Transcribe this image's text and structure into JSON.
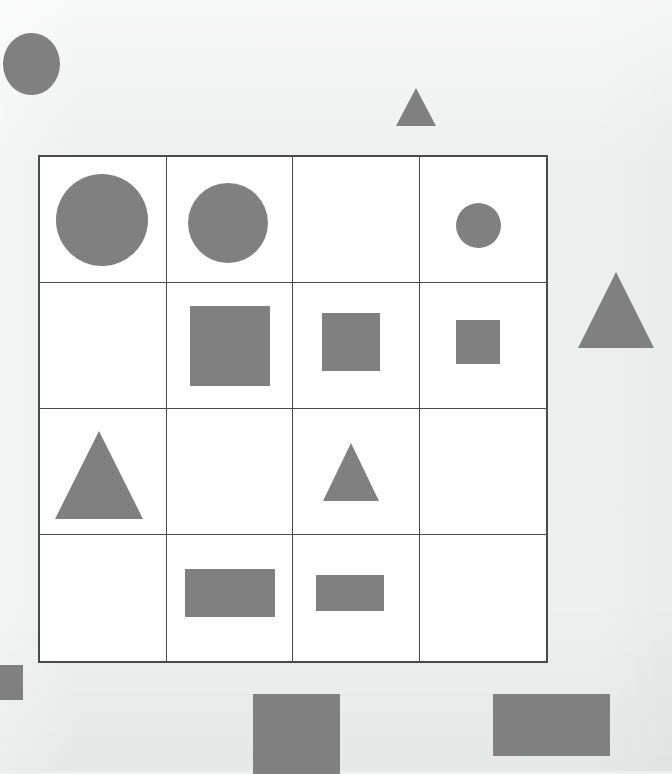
{
  "page": {
    "background_color": "#eef0ef",
    "width": 672,
    "height": 771
  },
  "matrix": {
    "name": "shape-matrix",
    "rows": 4,
    "cols": 4,
    "x": 38,
    "y": 155,
    "width": 510,
    "height": 508,
    "cell_width": 127,
    "cell_height": 127,
    "cell_fill": "#ffffff",
    "border_color": "#4a4a4a",
    "border_width": 2,
    "divider_width": 1,
    "shape_color": "#808080",
    "cells": [
      {
        "row": 0,
        "col": 0,
        "shape": "circle",
        "size": "large",
        "w": 92,
        "h": 92,
        "cx": 0.49,
        "cy": 0.5
      },
      {
        "row": 0,
        "col": 1,
        "shape": "circle",
        "size": "medium",
        "w": 80,
        "h": 80,
        "cx": 0.49,
        "cy": 0.52
      },
      {
        "row": 0,
        "col": 2,
        "shape": "none",
        "size": "",
        "w": 0,
        "h": 0,
        "cx": 0.5,
        "cy": 0.5
      },
      {
        "row": 0,
        "col": 3,
        "shape": "circle",
        "size": "small",
        "w": 45,
        "h": 45,
        "cx": 0.47,
        "cy": 0.54
      },
      {
        "row": 1,
        "col": 0,
        "shape": "none",
        "size": "",
        "w": 0,
        "h": 0,
        "cx": 0.5,
        "cy": 0.5
      },
      {
        "row": 1,
        "col": 1,
        "shape": "square",
        "size": "large",
        "w": 80,
        "h": 80,
        "cx": 0.5,
        "cy": 0.5
      },
      {
        "row": 1,
        "col": 2,
        "shape": "square",
        "size": "medium",
        "w": 58,
        "h": 58,
        "cx": 0.46,
        "cy": 0.47
      },
      {
        "row": 1,
        "col": 3,
        "shape": "square",
        "size": "small",
        "w": 44,
        "h": 44,
        "cx": 0.46,
        "cy": 0.47
      },
      {
        "row": 2,
        "col": 0,
        "shape": "triangle",
        "size": "large",
        "w": 88,
        "h": 88,
        "cx": 0.47,
        "cy": 0.52
      },
      {
        "row": 2,
        "col": 1,
        "shape": "none",
        "size": "",
        "w": 0,
        "h": 0,
        "cx": 0.5,
        "cy": 0.5
      },
      {
        "row": 2,
        "col": 2,
        "shape": "triangle",
        "size": "medium",
        "w": 56,
        "h": 58,
        "cx": 0.46,
        "cy": 0.5
      },
      {
        "row": 2,
        "col": 3,
        "shape": "none",
        "size": "",
        "w": 0,
        "h": 0,
        "cx": 0.5,
        "cy": 0.5
      },
      {
        "row": 3,
        "col": 0,
        "shape": "none",
        "size": "",
        "w": 0,
        "h": 0,
        "cx": 0.5,
        "cy": 0.5
      },
      {
        "row": 3,
        "col": 1,
        "shape": "rect",
        "size": "large",
        "w": 90,
        "h": 48,
        "cx": 0.5,
        "cy": 0.46
      },
      {
        "row": 3,
        "col": 2,
        "shape": "rect",
        "size": "medium",
        "w": 68,
        "h": 36,
        "cx": 0.45,
        "cy": 0.46
      },
      {
        "row": 3,
        "col": 3,
        "shape": "none",
        "size": "",
        "w": 0,
        "h": 0,
        "cx": 0.5,
        "cy": 0.5
      }
    ]
  },
  "distractors": [
    {
      "name": "distractor-circle-top-left",
      "shape": "circle",
      "x": 3,
      "y": 33,
      "w": 57,
      "h": 62,
      "color": "#808080"
    },
    {
      "name": "distractor-triangle-top",
      "shape": "triangle",
      "x": 396,
      "y": 88,
      "w": 40,
      "h": 38,
      "color": "#808080"
    },
    {
      "name": "distractor-triangle-right",
      "shape": "triangle",
      "x": 578,
      "y": 272,
      "w": 77,
      "h": 76,
      "color": "#808080"
    },
    {
      "name": "distractor-rect-bottom-left",
      "shape": "rect",
      "x": -8,
      "y": 665,
      "w": 31,
      "h": 35,
      "color": "#808080"
    },
    {
      "name": "distractor-rect-bottom-mid",
      "shape": "rect",
      "x": 253,
      "y": 694,
      "w": 87,
      "h": 80,
      "color": "#808080"
    },
    {
      "name": "distractor-rect-bottom-right",
      "shape": "rect",
      "x": 493,
      "y": 694,
      "w": 117,
      "h": 62,
      "color": "#808080"
    }
  ]
}
